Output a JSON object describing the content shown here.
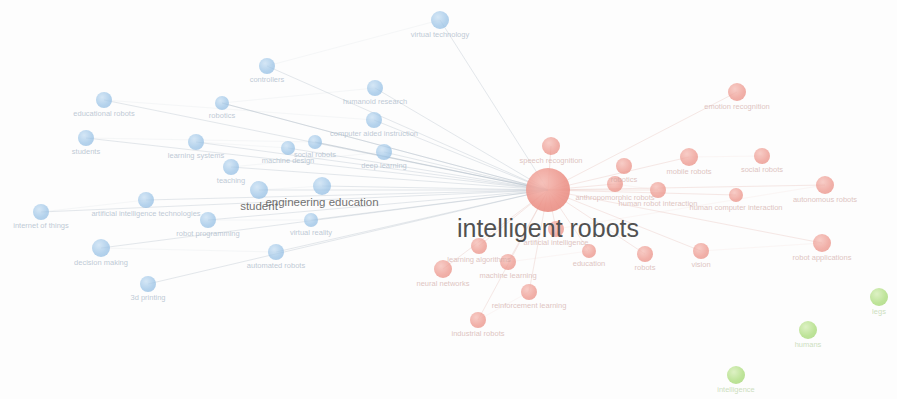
{
  "visualization": {
    "type": "network-graph",
    "title": "intelligent robots",
    "width": 897,
    "height": 399,
    "background_color": "#fdfdfd",
    "clusters": [
      {
        "id": "blue",
        "color": "#7fb3e0",
        "label": "education / learning cluster"
      },
      {
        "id": "red",
        "color": "#e8786b",
        "label": "robotics / AI cluster"
      },
      {
        "id": "green",
        "color": "#8fd14f",
        "label": "humans / intelligence cluster"
      }
    ],
    "edge_color": "#b9c4cd",
    "hub_label": "intelligent robots",
    "secondary_hub_label": "engineering education"
  },
  "chart_data": {
    "type": "scatter",
    "title": "intelligent robots",
    "xlabel": "",
    "ylabel": "",
    "legend_position": "none",
    "grid": false,
    "xlim": [
      0,
      897
    ],
    "ylim": [
      0,
      399
    ],
    "nodes": [
      {
        "label": "virtual technology",
        "x": 440,
        "y": 20,
        "r": 9,
        "cluster": "blue",
        "fs": 7.5
      },
      {
        "label": "controllers",
        "x": 267,
        "y": 66,
        "r": 8,
        "cluster": "blue",
        "fs": 7.5
      },
      {
        "label": "humanoid research",
        "x": 375,
        "y": 88,
        "r": 8,
        "cluster": "blue",
        "fs": 7.5
      },
      {
        "label": "robotics",
        "x": 222,
        "y": 103,
        "r": 7,
        "cluster": "blue",
        "fs": 7.5
      },
      {
        "label": "educational robots",
        "x": 104,
        "y": 100,
        "r": 8,
        "cluster": "blue",
        "fs": 7.5
      },
      {
        "label": "computer aided instruction",
        "x": 374,
        "y": 120,
        "r": 8,
        "cluster": "blue",
        "fs": 7.5
      },
      {
        "label": "students",
        "x": 86,
        "y": 138,
        "r": 8,
        "cluster": "blue",
        "fs": 7.5
      },
      {
        "label": "social robots",
        "x": 315,
        "y": 142,
        "r": 7,
        "cluster": "blue",
        "fs": 7.5
      },
      {
        "label": "learning systems",
        "x": 196,
        "y": 142,
        "r": 8,
        "cluster": "blue",
        "fs": 7.5
      },
      {
        "label": "machine design",
        "x": 288,
        "y": 148,
        "r": 7,
        "cluster": "blue",
        "fs": 7.5
      },
      {
        "label": "deep learning",
        "x": 384,
        "y": 152,
        "r": 8,
        "cluster": "blue",
        "fs": 7.5
      },
      {
        "label": "teaching",
        "x": 231,
        "y": 167,
        "r": 8,
        "cluster": "blue",
        "fs": 7.5
      },
      {
        "label": "engineering education",
        "x": 322,
        "y": 186,
        "r": 9,
        "cluster": "blue",
        "fs": 11.5,
        "emphasis": "hub2"
      },
      {
        "label": "student",
        "x": 259,
        "y": 190,
        "r": 9,
        "cluster": "blue",
        "fs": 11.5,
        "emphasis": "hub2"
      },
      {
        "label": "artificial intelligence technologies",
        "x": 146,
        "y": 200,
        "r": 8,
        "cluster": "blue",
        "fs": 7.5
      },
      {
        "label": "internet of things",
        "x": 41,
        "y": 212,
        "r": 8,
        "cluster": "blue",
        "fs": 7.5
      },
      {
        "label": "robot programming",
        "x": 208,
        "y": 220,
        "r": 8,
        "cluster": "blue",
        "fs": 7.5
      },
      {
        "label": "virtual reality",
        "x": 311,
        "y": 220,
        "r": 7,
        "cluster": "blue",
        "fs": 7.5
      },
      {
        "label": "decision making",
        "x": 101,
        "y": 248,
        "r": 9,
        "cluster": "blue",
        "fs": 7.5
      },
      {
        "label": "automated robots",
        "x": 276,
        "y": 252,
        "r": 8,
        "cluster": "blue",
        "fs": 7.5
      },
      {
        "label": "3d printing",
        "x": 148,
        "y": 284,
        "r": 8,
        "cluster": "blue",
        "fs": 7.5
      },
      {
        "label": "intelligent robots",
        "x": 548,
        "y": 190,
        "r": 22,
        "cluster": "red",
        "fs": 25,
        "emphasis": "hub"
      },
      {
        "label": "speech recognition",
        "x": 551,
        "y": 146,
        "r": 9,
        "cluster": "red",
        "fs": 7.5
      },
      {
        "label": "emotion recognition",
        "x": 737,
        "y": 92,
        "r": 9,
        "cluster": "red",
        "fs": 7.5
      },
      {
        "label": "social robots",
        "x": 762,
        "y": 156,
        "r": 8,
        "cluster": "red",
        "fs": 7.5
      },
      {
        "label": "mobile robots",
        "x": 689,
        "y": 157,
        "r": 9,
        "cluster": "red",
        "fs": 7.5
      },
      {
        "label": "robotics",
        "x": 624,
        "y": 166,
        "r": 8,
        "cluster": "red",
        "fs": 7.5
      },
      {
        "label": "anthropomorphic robots",
        "x": 615,
        "y": 184,
        "r": 8,
        "cluster": "red",
        "fs": 7.5
      },
      {
        "label": "human robot interaction",
        "x": 658,
        "y": 190,
        "r": 8,
        "cluster": "red",
        "fs": 7.5
      },
      {
        "label": "human computer interaction",
        "x": 736,
        "y": 195,
        "r": 7,
        "cluster": "red",
        "fs": 7.5
      },
      {
        "label": "autonomous robots",
        "x": 825,
        "y": 185,
        "r": 9,
        "cluster": "red",
        "fs": 7.5
      },
      {
        "label": "artificial intelligence",
        "x": 556,
        "y": 229,
        "r": 8,
        "cluster": "red",
        "fs": 7.5
      },
      {
        "label": "learning algorithms",
        "x": 479,
        "y": 246,
        "r": 8,
        "cluster": "red",
        "fs": 7.5
      },
      {
        "label": "machine learning",
        "x": 508,
        "y": 262,
        "r": 8,
        "cluster": "red",
        "fs": 7.5
      },
      {
        "label": "education",
        "x": 589,
        "y": 251,
        "r": 7,
        "cluster": "red",
        "fs": 7.5
      },
      {
        "label": "robots",
        "x": 645,
        "y": 254,
        "r": 8,
        "cluster": "red",
        "fs": 7.5
      },
      {
        "label": "vision",
        "x": 701,
        "y": 251,
        "r": 8,
        "cluster": "red",
        "fs": 7.5
      },
      {
        "label": "robot applications",
        "x": 822,
        "y": 243,
        "r": 9,
        "cluster": "red",
        "fs": 7.5
      },
      {
        "label": "neural networks",
        "x": 443,
        "y": 269,
        "r": 9,
        "cluster": "red",
        "fs": 7.5
      },
      {
        "label": "reinforcement learning",
        "x": 529,
        "y": 292,
        "r": 8,
        "cluster": "red",
        "fs": 7.5
      },
      {
        "label": "industrial robots",
        "x": 478,
        "y": 320,
        "r": 8,
        "cluster": "red",
        "fs": 7.5
      },
      {
        "label": "legs",
        "x": 879,
        "y": 297,
        "r": 9,
        "cluster": "green",
        "fs": 7.5
      },
      {
        "label": "humans",
        "x": 808,
        "y": 330,
        "r": 9,
        "cluster": "green",
        "fs": 7.5
      },
      {
        "label": "intelligence",
        "x": 736,
        "y": 375,
        "r": 9,
        "cluster": "green",
        "fs": 7.5
      }
    ],
    "edges_from_hub": [
      "speech recognition",
      "emotion recognition",
      "social robots",
      "mobile robots",
      "robotics",
      "anthropomorphic robots",
      "human robot interaction",
      "human computer interaction",
      "autonomous robots",
      "artificial intelligence",
      "learning algorithms",
      "machine learning",
      "education",
      "robots",
      "vision",
      "robot applications",
      "neural networks",
      "reinforcement learning",
      "industrial robots",
      "engineering education",
      "student",
      "learning systems",
      "machine design",
      "deep learning",
      "teaching",
      "social robots",
      "computer aided instruction",
      "humanoid research",
      "controllers",
      "virtual technology",
      "educational robots",
      "students",
      "robot programming",
      "virtual reality",
      "artificial intelligence technologies",
      "automated robots",
      "decision making",
      "internet of things",
      "3d printing",
      "robotics"
    ]
  }
}
